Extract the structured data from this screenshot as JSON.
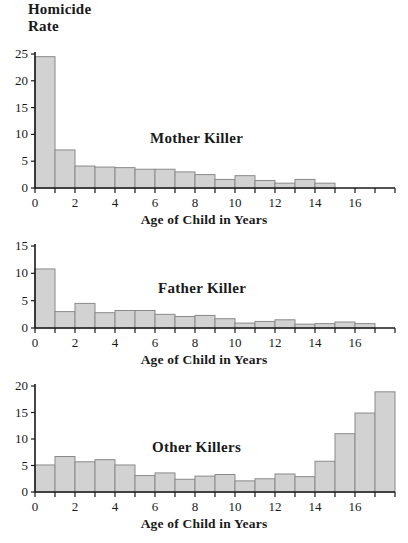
{
  "page_title_lines": [
    "Homicide",
    "Rate"
  ],
  "colors": {
    "bar_fill": "#d2d2d2",
    "bar_stroke": "#8a8a8a",
    "axis": "#1a1a1a",
    "text": "#1a1a1a",
    "background": "#ffffff"
  },
  "chart_data": [
    {
      "type": "bar",
      "title": "Mother Killer",
      "xlabel": "Age of Child in Years",
      "ylabel": "Homicide Rate",
      "grid": false,
      "legend": "none",
      "xlim": [
        0,
        18
      ],
      "ylim": [
        0,
        25
      ],
      "yticks": [
        0,
        5,
        10,
        15,
        20,
        25
      ],
      "xticks": [
        0,
        1,
        2,
        3,
        4,
        5,
        6,
        7,
        8,
        9,
        10,
        11,
        12,
        13,
        14,
        15,
        16,
        17,
        18
      ],
      "xtick_labels": [
        "0",
        "",
        "2",
        "",
        "4",
        "",
        "6",
        "",
        "8",
        "",
        "10",
        "",
        "12",
        "",
        "14",
        "",
        "16",
        "",
        ""
      ],
      "bin_edges": [
        0,
        1,
        2,
        3,
        4,
        5,
        6,
        7,
        8,
        9,
        10,
        11,
        12,
        13,
        14
      ],
      "categories": [
        "0-1",
        "1-2",
        "2-3",
        "3-4",
        "4-5",
        "5-6",
        "6-7",
        "7-8",
        "8-9",
        "9-10",
        "10-11",
        "11-12",
        "12-13",
        "13-14"
      ],
      "values": [
        24.5,
        7.1,
        4.1,
        3.9,
        3.8,
        3.5,
        3.5,
        3.0,
        2.5,
        1.6,
        2.3,
        1.4,
        0.9,
        1.6,
        0.9
      ]
    },
    {
      "type": "bar",
      "title": "Father Killer",
      "xlabel": "Age of Child in Years",
      "ylabel": "Homicide Rate",
      "grid": false,
      "legend": "none",
      "xlim": [
        0,
        18
      ],
      "ylim": [
        0,
        15
      ],
      "yticks": [
        0,
        5,
        10,
        15
      ],
      "xticks": [
        0,
        1,
        2,
        3,
        4,
        5,
        6,
        7,
        8,
        9,
        10,
        11,
        12,
        13,
        14,
        15,
        16,
        17,
        18
      ],
      "xtick_labels": [
        "0",
        "",
        "2",
        "",
        "4",
        "",
        "6",
        "",
        "8",
        "",
        "10",
        "",
        "12",
        "",
        "14",
        "",
        "16",
        "",
        ""
      ],
      "bin_edges": [
        0,
        1,
        2,
        3,
        4,
        5,
        6,
        7,
        8,
        9,
        10,
        11,
        12,
        13,
        14,
        15,
        16,
        17
      ],
      "categories": [
        "0-1",
        "1-2",
        "2-3",
        "3-4",
        "4-5",
        "5-6",
        "6-7",
        "7-8",
        "8-9",
        "9-10",
        "10-11",
        "11-12",
        "12-13",
        "13-14",
        "14-15",
        "15-16",
        "16-17"
      ],
      "values": [
        10.8,
        3.0,
        4.5,
        2.8,
        3.2,
        3.2,
        2.5,
        2.1,
        2.3,
        1.7,
        0.9,
        1.2,
        1.5,
        0.7,
        0.8,
        1.1,
        0.8
      ]
    },
    {
      "type": "bar",
      "title": "Other Killers",
      "xlabel": "Age of Child in Years",
      "ylabel": "Homicide Rate",
      "grid": false,
      "legend": "none",
      "xlim": [
        0,
        18
      ],
      "ylim": [
        0,
        20
      ],
      "yticks": [
        0,
        5,
        10,
        15,
        20
      ],
      "xticks": [
        0,
        1,
        2,
        3,
        4,
        5,
        6,
        7,
        8,
        9,
        10,
        11,
        12,
        13,
        14,
        15,
        16,
        17,
        18
      ],
      "xtick_labels": [
        "0",
        "",
        "2",
        "",
        "4",
        "",
        "6",
        "",
        "8",
        "",
        "10",
        "",
        "12",
        "",
        "14",
        "",
        "16",
        "",
        ""
      ],
      "bin_edges": [
        0,
        1,
        2,
        3,
        4,
        5,
        6,
        7,
        8,
        9,
        10,
        11,
        12,
        13,
        14,
        15,
        16,
        17,
        18
      ],
      "categories": [
        "0-1",
        "1-2",
        "2-3",
        "3-4",
        "4-5",
        "5-6",
        "6-7",
        "7-8",
        "8-9",
        "9-10",
        "10-11",
        "11-12",
        "12-13",
        "13-14",
        "14-15",
        "15-16",
        "16-17",
        "17-18"
      ],
      "values": [
        5.1,
        6.7,
        5.7,
        6.1,
        5.1,
        3.1,
        3.6,
        2.4,
        3.0,
        3.3,
        2.1,
        2.5,
        3.4,
        2.9,
        5.8,
        11.0,
        14.9,
        18.9
      ]
    }
  ],
  "panels": [
    {
      "series_label": "Mother Killer",
      "axis_title": "Age of Child in Years"
    },
    {
      "series_label": "Father Killer",
      "axis_title": "Age of Child in Years"
    },
    {
      "series_label": "Other Killers",
      "axis_title": "Age of Child in Years"
    }
  ]
}
